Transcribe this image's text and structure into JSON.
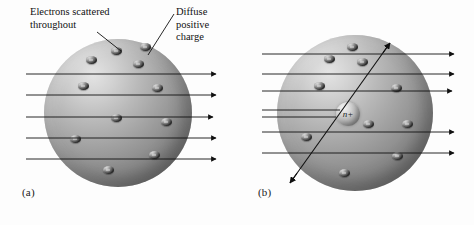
{
  "figure": {
    "background_color": "#fdfdfd",
    "line_color": "#101010",
    "sphere_light_color": "#e4e4e4",
    "sphere_dark_color": "#686868"
  },
  "panels": [
    {
      "id": "a",
      "label": "(a)",
      "model": "plum-pudding",
      "atom": {
        "cx": 118,
        "cy": 113,
        "r": 74
      },
      "callouts": [
        {
          "name": "electrons-scattered",
          "text": "Electrons scattered\nthroughout",
          "x": 30,
          "y": 6,
          "leader": {
            "x1": 97,
            "y1": 32,
            "x2": 121,
            "y2": 51
          }
        },
        {
          "name": "diffuse-positive-charge",
          "text": "Diffuse\npositive\ncharge",
          "x": 176,
          "y": 6,
          "leader": {
            "x1": 174,
            "y1": 14,
            "x2": 148,
            "y2": 55
          }
        }
      ],
      "electrons": [
        {
          "x": 116,
          "y": 51
        },
        {
          "x": 91,
          "y": 60
        },
        {
          "x": 138,
          "y": 64
        },
        {
          "x": 83,
          "y": 86
        },
        {
          "x": 157,
          "y": 88
        },
        {
          "x": 116,
          "y": 118
        },
        {
          "x": 166,
          "y": 122
        },
        {
          "x": 75,
          "y": 139
        },
        {
          "x": 154,
          "y": 155
        },
        {
          "x": 108,
          "y": 170
        },
        {
          "x": 145,
          "y": 47
        }
      ],
      "rays": [
        {
          "y": 74,
          "x1": 26,
          "x2": 216,
          "deflected": false
        },
        {
          "y": 95,
          "x1": 26,
          "x2": 216,
          "deflected": false
        },
        {
          "y": 117,
          "x1": 26,
          "x2": 213,
          "deflected": false
        },
        {
          "y": 138,
          "x1": 26,
          "x2": 216,
          "deflected": false
        },
        {
          "y": 159,
          "x1": 26,
          "x2": 216,
          "deflected": false
        }
      ],
      "ray_count": 5,
      "electron_count": 11
    },
    {
      "id": "b",
      "label": "(b)",
      "model": "nuclear",
      "atom": {
        "cx": 355,
        "cy": 113,
        "r": 78
      },
      "nucleus": {
        "cx": 348,
        "cy": 114,
        "r": 12,
        "label": "n+"
      },
      "electrons": [
        {
          "x": 352,
          "y": 47
        },
        {
          "x": 329,
          "y": 59
        },
        {
          "x": 362,
          "y": 62
        },
        {
          "x": 319,
          "y": 86
        },
        {
          "x": 396,
          "y": 88
        },
        {
          "x": 368,
          "y": 124
        },
        {
          "x": 407,
          "y": 124
        },
        {
          "x": 306,
          "y": 137
        },
        {
          "x": 397,
          "y": 156
        },
        {
          "x": 344,
          "y": 173
        }
      ],
      "rays": [
        {
          "y": 54,
          "x1": 262,
          "x2": 454,
          "deflected": false
        },
        {
          "y": 74,
          "x1": 262,
          "x2": 454,
          "deflected": false
        },
        {
          "y": 91,
          "x1": 262,
          "x2": 452,
          "deflected": false
        },
        {
          "y": 110,
          "x1": 262,
          "x2": 340,
          "deflected": true
        },
        {
          "y": 117,
          "x1": 262,
          "x2": 336,
          "deflected": true
        },
        {
          "y": 132,
          "x1": 262,
          "x2": 454,
          "deflected": false
        },
        {
          "y": 153,
          "x1": 262,
          "x2": 454,
          "deflected": false
        }
      ],
      "scattered_ray": {
        "x1": 290,
        "y1": 183,
        "x2": 390,
        "y2": 43
      },
      "ray_count": 7,
      "electron_count": 10
    }
  ]
}
